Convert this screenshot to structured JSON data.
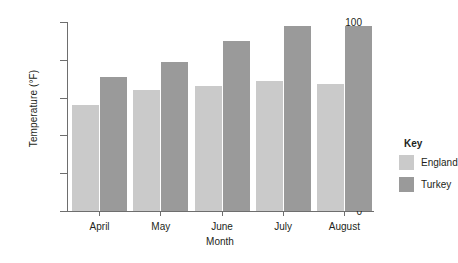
{
  "chart_data": {
    "type": "bar",
    "title": "",
    "xlabel": "Month",
    "ylabel": "Temperature (°F)",
    "categories": [
      "April",
      "May",
      "June",
      "July",
      "August"
    ],
    "series": [
      {
        "name": "England",
        "color": "#cacaca",
        "values": [
          56,
          64,
          66,
          69,
          67
        ]
      },
      {
        "name": "Turkey",
        "color": "#9a9a9a",
        "values": [
          71,
          79,
          90,
          98,
          98
        ]
      }
    ],
    "ylim": [
      0,
      100
    ],
    "yticks": [
      0,
      20,
      40,
      60,
      80,
      100
    ],
    "ytick_labels": [
      "0",
      "20",
      "40",
      "60",
      "80",
      "100"
    ],
    "grid": false,
    "legend": {
      "title": "Key",
      "position": "right",
      "entries": [
        "England",
        "Turkey"
      ]
    }
  },
  "axis": {
    "y_title": "Temperature (°F)",
    "x_title": "Month"
  },
  "legend": {
    "title": "Key",
    "items": [
      {
        "label": "England",
        "color": "#cacaca"
      },
      {
        "label": "Turkey",
        "color": "#9a9a9a"
      }
    ]
  }
}
